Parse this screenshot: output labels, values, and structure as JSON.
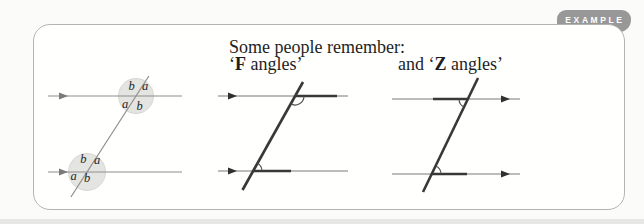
{
  "example_tab": {
    "label": "EXAMPLE",
    "background": "#989898",
    "text_color": "#ffffff"
  },
  "caption": {
    "intro": "Some people remember:",
    "f": {
      "pre": "‘",
      "bold": "F",
      "post": " angles’"
    },
    "z": {
      "pre": "and ‘",
      "bold": "Z",
      "post": " angles’"
    }
  },
  "diagrams": {
    "labelled_angles": {
      "top_intersection": {
        "above_left": "b",
        "above_right": "a",
        "below_left": "a",
        "below_right": "b"
      },
      "bottom_intersection": {
        "above_left": "b",
        "above_right": "a",
        "below_left": "a",
        "below_right": "b"
      },
      "disc_fill": "#e4e4e1"
    },
    "f_angles_figure": {
      "mnemonic_letter": "F"
    },
    "z_angles_figure": {
      "mnemonic_letter": "Z"
    }
  },
  "colors": {
    "tab_gray": "#989898",
    "box_border": "#b4b4b2",
    "thin_line": "#8e8e8e",
    "thick_line": "#383838",
    "text": "#1e1e1e"
  }
}
